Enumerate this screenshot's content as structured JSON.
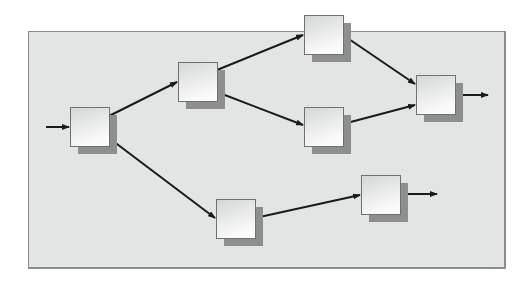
{
  "diagram": {
    "type": "flow-network",
    "panel": {
      "x": 28,
      "y": 31,
      "width": 478,
      "height": 238,
      "fill": "#e3e5e5",
      "border": "#8a8c8c"
    },
    "node_size": 39,
    "shadow_offset": 8,
    "colors": {
      "box_top": "#d4d6d6",
      "box_bottom": "#fbfbfb",
      "shadow": "#8c8e8f",
      "edge": "#1a1a1a"
    },
    "nodes": [
      {
        "id": "A",
        "x": 70,
        "y": 107,
        "label": ""
      },
      {
        "id": "B",
        "x": 178,
        "y": 62,
        "label": ""
      },
      {
        "id": "C",
        "x": 304,
        "y": 15,
        "label": ""
      },
      {
        "id": "D",
        "x": 304,
        "y": 107,
        "label": ""
      },
      {
        "id": "E",
        "x": 416,
        "y": 75,
        "label": ""
      },
      {
        "id": "F",
        "x": 216,
        "y": 199,
        "label": ""
      },
      {
        "id": "G",
        "x": 361,
        "y": 175,
        "label": ""
      }
    ],
    "edges": [
      {
        "from": "input",
        "to": "A",
        "x1": 46,
        "y1": 127,
        "x2": 69,
        "y2": 127
      },
      {
        "from": "A",
        "to": "B",
        "x1": 109,
        "y1": 116,
        "x2": 177,
        "y2": 82
      },
      {
        "from": "A",
        "to": "F",
        "x1": 109,
        "y1": 138,
        "x2": 215,
        "y2": 218
      },
      {
        "from": "B",
        "to": "C",
        "x1": 217,
        "y1": 70,
        "x2": 303,
        "y2": 35
      },
      {
        "from": "B",
        "to": "D",
        "x1": 217,
        "y1": 92,
        "x2": 303,
        "y2": 125
      },
      {
        "from": "C",
        "to": "E",
        "x1": 343,
        "y1": 35,
        "x2": 415,
        "y2": 84
      },
      {
        "from": "D",
        "to": "E",
        "x1": 343,
        "y1": 124,
        "x2": 415,
        "y2": 105
      },
      {
        "from": "E",
        "to": "output",
        "x1": 455,
        "y1": 95,
        "x2": 488,
        "y2": 95
      },
      {
        "from": "F",
        "to": "G",
        "x1": 255,
        "y1": 218,
        "x2": 360,
        "y2": 195
      },
      {
        "from": "G",
        "to": "output",
        "x1": 400,
        "y1": 194,
        "x2": 437,
        "y2": 194
      }
    ]
  }
}
